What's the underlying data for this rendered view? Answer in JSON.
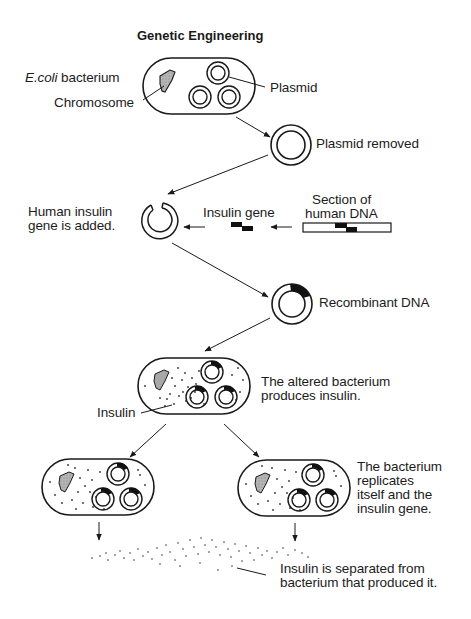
{
  "title": "Genetic Engineering",
  "labels": {
    "ecoli_italic": "E.coli",
    "ecoli_rest": " bacterium",
    "chromosome": "Chromosome",
    "plasmid": "Plasmid",
    "plasmid_removed": "Plasmid removed",
    "human_insulin_line1": "Human insulin",
    "human_insulin_line2": "gene is added.",
    "insulin_gene": "Insulin gene",
    "section_line1": "Section of",
    "section_line2": "human DNA",
    "recombinant": "Recombinant DNA",
    "altered_line1": "The altered bacterium",
    "altered_line2": "produces insulin.",
    "insulin": "Insulin",
    "replicates_line1": "The bacterium",
    "replicates_line2": "replicates",
    "replicates_line3": "itself and the",
    "replicates_line4": "insulin gene.",
    "separated_line1": "Insulin is separated from",
    "separated_line2": "bacterium that produced it."
  },
  "colors": {
    "stroke": "#1a1a1a",
    "chromosome_fill": "#a8a8a8",
    "background": "#ffffff"
  },
  "steps": [
    "E.coli bacterium with chromosome and plasmids",
    "Plasmid removed",
    "Human insulin gene is added",
    "Recombinant DNA",
    "The altered bacterium produces insulin",
    "The bacterium replicates itself and the insulin gene",
    "Insulin is separated from bacterium that produced it"
  ]
}
